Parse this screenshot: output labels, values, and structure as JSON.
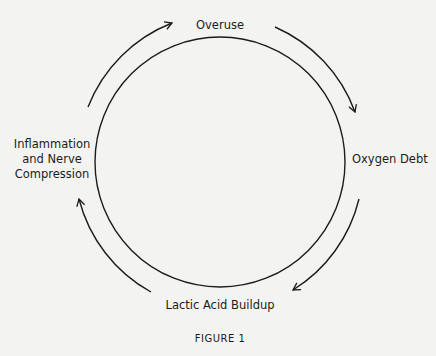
{
  "diagram": {
    "type": "cycle",
    "nodes": [
      {
        "id": "overuse",
        "label": "Overuse"
      },
      {
        "id": "oxygen_debt",
        "label": "Oxygen Debt"
      },
      {
        "id": "lactic_acid",
        "label": "Lactic Acid Buildup"
      },
      {
        "id": "inflammation",
        "label_lines": [
          "Inflammation",
          "and Nerve",
          "Compression"
        ]
      }
    ],
    "edges": [
      {
        "from": "overuse",
        "to": "oxygen_debt"
      },
      {
        "from": "oxygen_debt",
        "to": "lactic_acid"
      },
      {
        "from": "lactic_acid",
        "to": "inflammation"
      },
      {
        "from": "inflammation",
        "to": "overuse"
      }
    ],
    "caption": "FIGURE 1"
  }
}
